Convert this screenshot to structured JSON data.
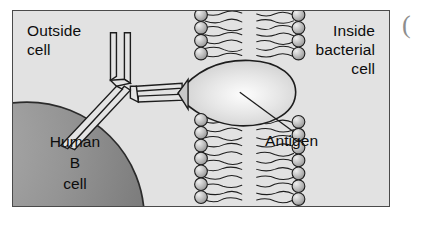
{
  "figure": {
    "kind": "biology-diagram",
    "background_color": "#e2e2e2",
    "border_color": "#4a4a4a",
    "labels": {
      "outside_cell": "Outside\ncell",
      "inside_bacterial_cell": "Inside\nbacterial\ncell",
      "human_b_cell": "Human\nB\ncell",
      "antigen": "Antigen"
    },
    "structures": [
      {
        "name": "human-b-cell",
        "shape": "quarter-circle at lower-left",
        "fill": "#8c8c8c",
        "outline": "#2b2b2b"
      },
      {
        "name": "antibody",
        "shape": "Y-shaped outlined molecule",
        "fill": "#e2e2e2",
        "outline": "#2b2b2b",
        "arms": 2,
        "stem_lines": 3
      },
      {
        "name": "lipid-bilayer-membrane",
        "head_count_per_column": 11,
        "head_fill": "#b4b4b4",
        "tail_color": "#1d1d1d"
      },
      {
        "name": "antigen",
        "shape": "teardrop with pointed left tip",
        "fill": "#d3d3d3",
        "highlight": "#f6f6f6",
        "outline": "#1d1d1d"
      }
    ],
    "edge_artifact": "("
  }
}
